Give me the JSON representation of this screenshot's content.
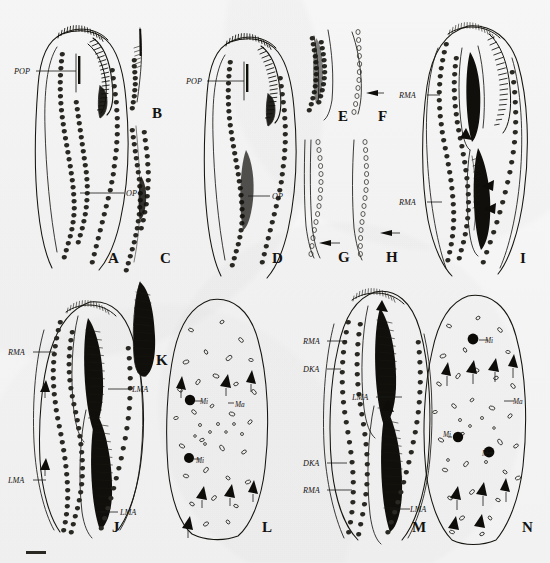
{
  "figure": {
    "type": "scientific-illustration-plate",
    "background_color": "#f7f7f8",
    "ink_color": "#15130f",
    "panel_count": 14,
    "rows": 2,
    "caption_partial": "partially cropped caption line at bottom edge"
  },
  "panels": [
    {
      "id": "A",
      "letter": "A",
      "letter_x": 108,
      "letter_y": 263,
      "description": "whole-cell ventral view with oral apparatus and ciliary rows",
      "labels": [
        {
          "text": "POP",
          "x": 14,
          "y": 74
        },
        {
          "text": "OP",
          "x": 126,
          "y": 196
        }
      ]
    },
    {
      "id": "B",
      "letter": "B",
      "letter_x": 152,
      "letter_y": 118,
      "description": "detail of anterior ciliary row fragment",
      "labels": []
    },
    {
      "id": "C",
      "letter": "C",
      "letter_x": 160,
      "letter_y": 263,
      "description": "detail of mid-body ciliary row fragment",
      "labels": []
    },
    {
      "id": "D",
      "letter": "D",
      "letter_x": 272,
      "letter_y": 263,
      "description": "whole-cell ventral view, second specimen",
      "labels": [
        {
          "text": "POP",
          "x": 186,
          "y": 84
        },
        {
          "text": "OP",
          "x": 272,
          "y": 199
        }
      ]
    },
    {
      "id": "E",
      "letter": "E",
      "letter_x": 338,
      "letter_y": 121,
      "description": "dense kinety detail",
      "labels": []
    },
    {
      "id": "F",
      "letter": "F",
      "letter_x": 378,
      "letter_y": 121,
      "description": "kinety detail with arrow marking break",
      "labels": [],
      "arrows": [
        {
          "x": 370,
          "y": 92,
          "dir": "left"
        }
      ]
    },
    {
      "id": "G",
      "letter": "G",
      "letter_x": 338,
      "letter_y": 262,
      "description": "posterior kinety detail with arrow",
      "labels": [],
      "arrows": [
        {
          "x": 331,
          "y": 243,
          "dir": "left"
        }
      ]
    },
    {
      "id": "H",
      "letter": "H",
      "letter_x": 386,
      "letter_y": 262,
      "description": "posterior kinety detail with arrow",
      "labels": [],
      "arrows": [
        {
          "x": 381,
          "y": 233,
          "dir": "left"
        }
      ]
    },
    {
      "id": "I",
      "letter": "I",
      "letter_x": 520,
      "letter_y": 263,
      "description": "whole-cell view showing two membranelle zones",
      "labels": [
        {
          "text": "RMA",
          "x": 399,
          "y": 98
        },
        {
          "text": "RMA",
          "x": 399,
          "y": 205
        }
      ],
      "arrowheads": [
        {
          "x": 470,
          "y": 133
        },
        {
          "x": 480,
          "y": 184
        },
        {
          "x": 482,
          "y": 206
        }
      ]
    },
    {
      "id": "J",
      "letter": "J",
      "letter_x": 112,
      "letter_y": 532,
      "description": "doublet cell with two oral primordia",
      "labels": [
        {
          "text": "RMA",
          "x": 8,
          "y": 355
        },
        {
          "text": "LMA",
          "x": 132,
          "y": 392
        },
        {
          "text": "LMA",
          "x": 8,
          "y": 483
        },
        {
          "text": "LMA",
          "x": 120,
          "y": 515
        }
      ],
      "arrows": [
        {
          "x": 42,
          "y": 388,
          "dir": "up"
        },
        {
          "x": 42,
          "y": 465,
          "dir": "up"
        }
      ]
    },
    {
      "id": "K",
      "letter": "K",
      "letter_x": 156,
      "letter_y": 365,
      "description": "isolated hatched membranelle band",
      "labels": []
    },
    {
      "id": "L",
      "letter": "L",
      "letter_x": 262,
      "letter_y": 532,
      "description": "nuclear apparatus and cortical granules, silver impregnation",
      "labels": [
        {
          "text": "Mi",
          "x": 200,
          "y": 404
        },
        {
          "text": "Ma",
          "x": 235,
          "y": 407
        },
        {
          "text": "Mi",
          "x": 196,
          "y": 463
        }
      ]
    },
    {
      "id": "M",
      "letter": "M",
      "letter_x": 412,
      "letter_y": 532,
      "description": "doublet cell, infraciliature with dorsal kineties",
      "labels": [
        {
          "text": "RMA",
          "x": 303,
          "y": 344
        },
        {
          "text": "DKA",
          "x": 303,
          "y": 372
        },
        {
          "text": "LMA",
          "x": 352,
          "y": 400
        },
        {
          "text": "DKA",
          "x": 303,
          "y": 466
        },
        {
          "text": "RMA",
          "x": 303,
          "y": 493
        },
        {
          "text": "LMA",
          "x": 410,
          "y": 512
        }
      ]
    },
    {
      "id": "N",
      "letter": "N",
      "letter_x": 522,
      "letter_y": 532,
      "description": "nuclear apparatus with three micronuclei and macronuclear nodules",
      "labels": [
        {
          "text": "Mi",
          "x": 485,
          "y": 343
        },
        {
          "text": "Ma",
          "x": 513,
          "y": 404
        },
        {
          "text": "Mi",
          "x": 443,
          "y": 437
        },
        {
          "text": "Mi",
          "x": 482,
          "y": 456
        }
      ]
    }
  ],
  "legend_keys": [
    {
      "abbr": "POP",
      "meaning": "posterior oral primordium"
    },
    {
      "abbr": "OP",
      "meaning": "oral primordium"
    },
    {
      "abbr": "RMA",
      "meaning": "right marginal row"
    },
    {
      "abbr": "LMA",
      "meaning": "left marginal row"
    },
    {
      "abbr": "DKA",
      "meaning": "dorsal kinety"
    },
    {
      "abbr": "Mi",
      "meaning": "micronucleus"
    },
    {
      "abbr": "Ma",
      "meaning": "macronucleus"
    }
  ],
  "caption": {
    "bar_visible": true,
    "text": ""
  }
}
